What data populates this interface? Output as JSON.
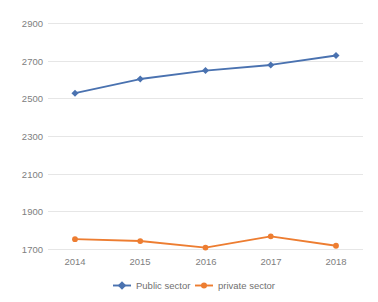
{
  "chart_data": {
    "type": "line",
    "title": "",
    "subtitle": "",
    "xlabel": "",
    "ylabel": "",
    "categories": [
      "2014",
      "2015",
      "2016",
      "2017",
      "2018"
    ],
    "series": [
      {
        "name": "Public sector",
        "color": "#4a72b0",
        "values": [
          2530,
          2605,
          2650,
          2680,
          2730
        ]
      },
      {
        "name": "private sector",
        "color": "#ed7d31",
        "values": [
          1755,
          1745,
          1710,
          1770,
          1720
        ]
      }
    ],
    "ylim": [
      1700,
      2900
    ],
    "yticks": [
      "1700",
      "1900",
      "2100",
      "2300",
      "2500",
      "2700",
      "2900"
    ],
    "ytick_values": [
      1700,
      1900,
      2100,
      2300,
      2500,
      2700,
      2900
    ],
    "grid": true,
    "grid_color": "#e6e6e6",
    "legend_position": "bottom",
    "axis_label_color": "#808080",
    "background": "#ffffff"
  },
  "legend": {
    "items": [
      {
        "label": "Public sector",
        "color": "#4a72b0",
        "marker": "diamond-marker"
      },
      {
        "label": "private sector",
        "color": "#ed7d31",
        "marker": "circle-marker"
      }
    ]
  }
}
